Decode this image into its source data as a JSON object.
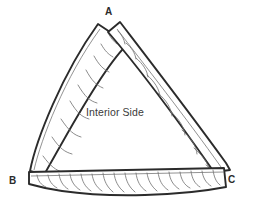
{
  "figure": {
    "type": "technical-line-drawing",
    "background_color": "#ffffff",
    "outline_color": "#2b2b2b",
    "hatch_color": "#6e6e6e"
  },
  "labels": {
    "apex": "A",
    "bottom_left": "B",
    "bottom_right": "C",
    "interior": "Interior Side"
  },
  "members": [
    {
      "name": "left-strip",
      "from": "B",
      "to": "A",
      "hatch_count": 9,
      "description": "left leg strip with curved arc hatching, tip overshoots apex to the right"
    },
    {
      "name": "right-strip",
      "from": "C",
      "to": "A",
      "hatch_count": 9,
      "description": "right leg strip with curved arc hatching, tip overshoots apex to the left"
    },
    {
      "name": "bottom-strip",
      "from": "B",
      "to": "C",
      "hatch_count": 17,
      "description": "bottom strip with closely spaced curved barb hatching"
    }
  ]
}
